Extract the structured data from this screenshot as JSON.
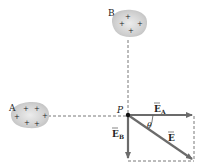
{
  "diagram": {
    "title": "",
    "colors": {
      "vector": "#6b6b6b",
      "dashed": "#555555",
      "blob_fill": "#c9c9c9",
      "blob_highlight": "#e6e6e6",
      "text": "#222222"
    },
    "charges": [
      {
        "id": "B",
        "label": "B",
        "signs": [
          "+",
          "+",
          "+",
          "+"
        ]
      },
      {
        "id": "A",
        "label": "A",
        "signs": [
          "+",
          "+",
          "+",
          "+",
          "+",
          "+"
        ]
      }
    ],
    "point": {
      "label": "P"
    },
    "vectors": [
      {
        "id": "E_A",
        "label": "E",
        "subscript": "A",
        "direction": "right"
      },
      {
        "id": "E_B",
        "label": "E",
        "subscript": "B",
        "direction": "down"
      },
      {
        "id": "E",
        "label": "E",
        "subscript": "",
        "direction": "diagonal down-right"
      }
    ],
    "angle": {
      "label": "θ"
    }
  }
}
